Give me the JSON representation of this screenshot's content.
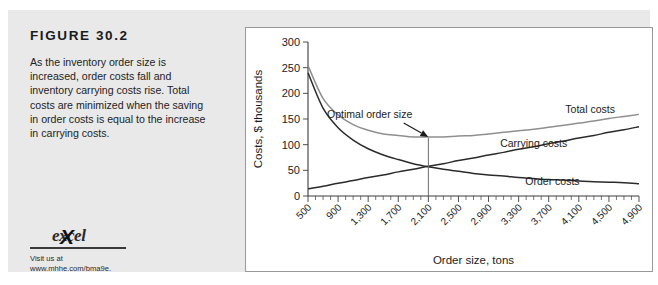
{
  "figure": {
    "title": "FIGURE 30.2",
    "caption": "As the inventory order size is increased, order costs fall and inventory carrying costs rise. Total costs are minimized when the saving in order costs is equal to the increase in carrying costs.",
    "panel_background": "#e9e9e9"
  },
  "excel": {
    "logo_text": "excel",
    "logo_x": "X",
    "visit_line_1": "Visit us at",
    "visit_line_2": "www.mhhe.com/bma9e."
  },
  "chart_data": {
    "type": "line",
    "title": "",
    "xlabel": "Order size, tons",
    "ylabel": "Costs, $ thousands",
    "xlim": [
      500,
      4900
    ],
    "ylim": [
      0,
      300
    ],
    "grid": false,
    "legend_position": "inline-right",
    "x_tick_labels": [
      "500",
      "900",
      "1,300",
      "1,700",
      "2,100",
      "2,500",
      "2,900",
      "3,300",
      "3,700",
      "4,100",
      "4,500",
      "4,900"
    ],
    "x_tick_values": [
      500,
      900,
      1300,
      1700,
      2100,
      2500,
      2900,
      3300,
      3700,
      4100,
      4500,
      4900
    ],
    "x_minor_tick_step": 100,
    "y_tick_labels": [
      "0",
      "50",
      "100",
      "150",
      "200",
      "250",
      "300"
    ],
    "y_tick_values": [
      0,
      50,
      100,
      150,
      200,
      250,
      300
    ],
    "x": [
      500,
      700,
      900,
      1100,
      1300,
      1500,
      1700,
      1900,
      2100,
      2300,
      2500,
      2700,
      2900,
      3100,
      3300,
      3500,
      3700,
      3900,
      4100,
      4300,
      4500,
      4700,
      4900
    ],
    "series": [
      {
        "name": "Order costs",
        "color": "#2b2b2b",
        "label_x": 3750,
        "label_y": 22,
        "values": [
          240,
          171,
          133,
          109,
          92,
          80,
          71,
          63,
          57,
          52,
          48,
          44,
          41,
          39,
          36,
          34,
          32,
          31,
          29,
          28,
          27,
          26,
          24
        ]
      },
      {
        "name": "Carrying costs",
        "color": "#2b2b2b",
        "label_x": 3500,
        "label_y": 96,
        "values": [
          14,
          19,
          25,
          30,
          36,
          41,
          47,
          52,
          58,
          63,
          69,
          74,
          80,
          85,
          91,
          96,
          102,
          107,
          113,
          118,
          124,
          129,
          135
        ]
      },
      {
        "name": "Total costs",
        "color": "#8f8f8f",
        "label_x": 4250,
        "label_y": 162,
        "values": [
          254,
          190,
          158,
          139,
          128,
          121,
          118,
          115,
          115,
          115,
          117,
          118,
          121,
          124,
          127,
          130,
          134,
          138,
          142,
          146,
          151,
          155,
          159
        ]
      }
    ],
    "annotations": [
      {
        "text": "Optimal order size",
        "point_x": 2100,
        "point_y": 113,
        "label_x": 1320,
        "label_y": 152
      }
    ]
  }
}
